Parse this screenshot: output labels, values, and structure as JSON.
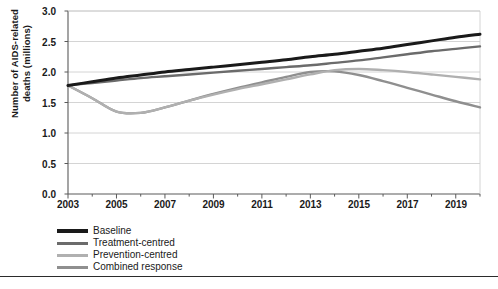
{
  "chart_data": {
    "type": "line",
    "title": "",
    "xlabel": "",
    "ylabel": "Number of AIDS-related deaths (millions)",
    "ylabel_line1": "Number of AIDS-related",
    "ylabel_line2": "deaths (millions)",
    "xlim": [
      2003,
      2020
    ],
    "ylim": [
      0.0,
      3.0
    ],
    "grid": "horizontal",
    "legend_position": "below-left",
    "x": [
      2003,
      2004,
      2005,
      2006,
      2007,
      2008,
      2009,
      2010,
      2011,
      2012,
      2013,
      2014,
      2015,
      2016,
      2017,
      2018,
      2019,
      2020
    ],
    "xticks": [
      "2003",
      "2005",
      "2007",
      "2009",
      "2011",
      "2013",
      "2015",
      "2017",
      "2019"
    ],
    "xtick_values": [
      2003,
      2005,
      2007,
      2009,
      2011,
      2013,
      2015,
      2017,
      2019
    ],
    "yticks": [
      "0.0",
      "0.5",
      "1.0",
      "1.5",
      "2.0",
      "2.5",
      "3.0"
    ],
    "ytick_values": [
      0.0,
      0.5,
      1.0,
      1.5,
      2.0,
      2.5,
      3.0
    ],
    "series": [
      {
        "name": "Baseline",
        "color": "#1a1a1a",
        "width": 3.0,
        "values": [
          1.78,
          1.84,
          1.9,
          1.95,
          2.0,
          2.04,
          2.08,
          2.12,
          2.16,
          2.2,
          2.25,
          2.29,
          2.34,
          2.39,
          2.45,
          2.51,
          2.57,
          2.62
        ]
      },
      {
        "name": "Treatment-centred",
        "color": "#6b6b6b",
        "width": 2.4,
        "values": [
          1.78,
          1.82,
          1.86,
          1.9,
          1.93,
          1.96,
          1.99,
          2.02,
          2.05,
          2.08,
          2.11,
          2.15,
          2.19,
          2.24,
          2.29,
          2.34,
          2.38,
          2.42
        ]
      },
      {
        "name": "Prevention-centred",
        "color": "#b0b0b0",
        "width": 2.4,
        "values": [
          1.78,
          1.57,
          1.35,
          1.33,
          1.42,
          1.53,
          1.63,
          1.72,
          1.8,
          1.88,
          1.96,
          2.03,
          2.05,
          2.03,
          2.0,
          1.96,
          1.92,
          1.88
        ]
      },
      {
        "name": "Combined response",
        "color": "#8f8f8f",
        "width": 2.4,
        "values": [
          1.78,
          1.57,
          1.35,
          1.33,
          1.42,
          1.53,
          1.64,
          1.74,
          1.83,
          1.92,
          2.0,
          2.01,
          1.95,
          1.85,
          1.74,
          1.63,
          1.52,
          1.42
        ]
      }
    ],
    "legend": [
      {
        "label": "Baseline",
        "color": "#1a1a1a"
      },
      {
        "label": "Treatment-centred",
        "color": "#6b6b6b"
      },
      {
        "label": "Prevention-centred",
        "color": "#b0b0b0"
      },
      {
        "label": "Combined response",
        "color": "#8f8f8f"
      }
    ]
  },
  "footer": {
    "caption": ""
  }
}
